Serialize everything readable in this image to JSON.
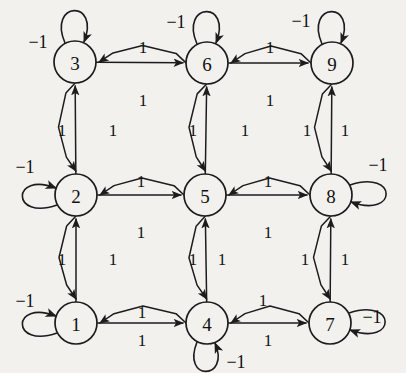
{
  "figure": {
    "type": "directed-graph",
    "background_color": "#f2f1ee",
    "ink_color": "#1c1c1c",
    "node_radius": 21
  },
  "nodes": [
    {
      "id": "3",
      "label": "3",
      "cx": 75,
      "cy": 62,
      "loop_label": "-1",
      "loop_dir": "up",
      "loop_label_x": 38,
      "loop_label_y": 42
    },
    {
      "id": "6",
      "label": "6",
      "cx": 207,
      "cy": 63,
      "loop_label": "-1",
      "loop_dir": "up",
      "loop_label_x": 176,
      "loop_label_y": 22
    },
    {
      "id": "9",
      "label": "9",
      "cx": 332,
      "cy": 63,
      "loop_label": "-1",
      "loop_dir": "up",
      "loop_label_x": 301,
      "loop_label_y": 21
    },
    {
      "id": "2",
      "label": "2",
      "cx": 76,
      "cy": 195,
      "loop_label": "-1",
      "loop_dir": "left",
      "loop_label_x": 25,
      "loop_label_y": 167
    },
    {
      "id": "5",
      "label": "5",
      "cx": 205,
      "cy": 195,
      "loop_label": "",
      "loop_dir": "none",
      "loop_label_x": 0,
      "loop_label_y": 0
    },
    {
      "id": "8",
      "label": "8",
      "cx": 331,
      "cy": 195,
      "loop_label": "-1",
      "loop_dir": "right",
      "loop_label_x": 378,
      "loop_label_y": 165
    },
    {
      "id": "1",
      "label": "1",
      "cx": 76,
      "cy": 323,
      "loop_label": "-1",
      "loop_dir": "left",
      "loop_label_x": 25,
      "loop_label_y": 301
    },
    {
      "id": "4",
      "label": "4",
      "cx": 207,
      "cy": 323,
      "loop_label": "-1",
      "loop_dir": "down",
      "loop_label_x": 236,
      "loop_label_y": 362
    },
    {
      "id": "7",
      "label": "7",
      "cx": 330,
      "cy": 323,
      "loop_label": "-1",
      "loop_dir": "right",
      "loop_label_x": 372,
      "loop_label_y": 317
    }
  ],
  "edges": [
    {
      "from": "3",
      "to": "6",
      "weight": "1",
      "style": "straight",
      "label_x": 143,
      "label_y": 47
    },
    {
      "from": "6",
      "to": "3",
      "weight": "1",
      "style": "bent",
      "label_x": 143,
      "label_y": 100
    },
    {
      "from": "6",
      "to": "9",
      "weight": "1",
      "style": "straight",
      "label_x": 270,
      "label_y": 47
    },
    {
      "from": "9",
      "to": "6",
      "weight": "1",
      "style": "bent",
      "label_x": 270,
      "label_y": 100
    },
    {
      "from": "2",
      "to": "5",
      "weight": "1",
      "style": "straight",
      "label_x": 141,
      "label_y": 181
    },
    {
      "from": "5",
      "to": "2",
      "weight": "1",
      "style": "bent",
      "label_x": 141,
      "label_y": 232
    },
    {
      "from": "5",
      "to": "8",
      "weight": "1",
      "style": "straight",
      "label_x": 268,
      "label_y": 181
    },
    {
      "from": "8",
      "to": "5",
      "weight": "1",
      "style": "bent",
      "label_x": 268,
      "label_y": 232
    },
    {
      "from": "1",
      "to": "4",
      "weight": "1",
      "style": "straight",
      "label_x": 142,
      "label_y": 340
    },
    {
      "from": "4",
      "to": "1",
      "weight": "1",
      "style": "bent",
      "label_x": 142,
      "label_y": 312
    },
    {
      "from": "4",
      "to": "7",
      "weight": "1",
      "style": "straight",
      "label_x": 268,
      "label_y": 340
    },
    {
      "from": "7",
      "to": "4",
      "weight": "1",
      "style": "bent",
      "label_x": 263,
      "label_y": 300
    },
    {
      "from": "2",
      "to": "3",
      "weight": "1",
      "style": "straight",
      "label_x": 62,
      "label_y": 130
    },
    {
      "from": "3",
      "to": "2",
      "weight": "1",
      "style": "bent",
      "label_x": 113,
      "label_y": 130
    },
    {
      "from": "1",
      "to": "2",
      "weight": "1",
      "style": "straight",
      "label_x": 62,
      "label_y": 259
    },
    {
      "from": "2",
      "to": "1",
      "weight": "1",
      "style": "bent",
      "label_x": 113,
      "label_y": 259
    },
    {
      "from": "5",
      "to": "6",
      "weight": "1",
      "style": "straight",
      "label_x": 193,
      "label_y": 130
    },
    {
      "from": "6",
      "to": "5",
      "weight": "1",
      "style": "bent",
      "label_x": 245,
      "label_y": 130
    },
    {
      "from": "4",
      "to": "5",
      "weight": "1",
      "style": "straight",
      "label_x": 193,
      "label_y": 259
    },
    {
      "from": "5",
      "to": "4",
      "weight": "1",
      "style": "bent",
      "label_x": 222,
      "label_y": 259
    },
    {
      "from": "8",
      "to": "9",
      "weight": "1",
      "style": "straight",
      "label_x": 345,
      "label_y": 130
    },
    {
      "from": "9",
      "to": "8",
      "weight": "1",
      "style": "bent",
      "label_x": 307,
      "label_y": 130
    },
    {
      "from": "7",
      "to": "8",
      "weight": "1",
      "style": "straight",
      "label_x": 345,
      "label_y": 259
    },
    {
      "from": "8",
      "to": "7",
      "weight": "1",
      "style": "bent",
      "label_x": 305,
      "label_y": 259
    }
  ]
}
